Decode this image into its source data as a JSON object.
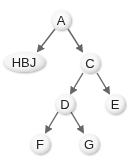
{
  "diagram": {
    "type": "tree",
    "edge_color": "#666666",
    "node_fill_center": "#ffffff",
    "node_fill_edge": "#dcdcdc",
    "text_color": "#222222",
    "nodes": [
      {
        "id": "A",
        "label": "A",
        "shape": "circle"
      },
      {
        "id": "HBJ",
        "label": "HBJ",
        "shape": "ellipse"
      },
      {
        "id": "C",
        "label": "C",
        "shape": "circle"
      },
      {
        "id": "D",
        "label": "D",
        "shape": "circle"
      },
      {
        "id": "E",
        "label": "E",
        "shape": "circle"
      },
      {
        "id": "F",
        "label": "F",
        "shape": "circle"
      },
      {
        "id": "G",
        "label": "G",
        "shape": "circle"
      }
    ],
    "edges": [
      {
        "from": "A",
        "to": "HBJ"
      },
      {
        "from": "A",
        "to": "C"
      },
      {
        "from": "C",
        "to": "D"
      },
      {
        "from": "C",
        "to": "E"
      },
      {
        "from": "D",
        "to": "F"
      },
      {
        "from": "D",
        "to": "G"
      }
    ]
  }
}
